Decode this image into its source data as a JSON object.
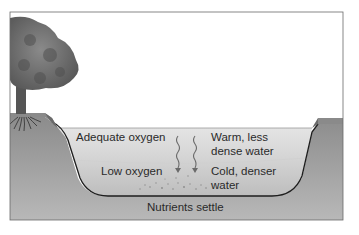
{
  "diagram": {
    "type": "lake-stratification-cross-section",
    "colors": {
      "background": "#ffffff",
      "frame": "#6a6a6a",
      "sky": "#ffffff",
      "soil": "#9c9c9c",
      "soil_dark": "#7d7d7d",
      "water_upper": "#dcdcdc",
      "water_lower": "#c2c2c2",
      "lake_bed_line": "#1e1e1e",
      "tree_canopy": "#6e6e6e",
      "tree_trunk": "#555555",
      "grass_bank": "#8a8a8a",
      "text": "#2a2a2a"
    },
    "labels": {
      "upper_left": "Adequate oxygen",
      "upper_right_line1": "Warm, less",
      "upper_right_line2": "dense water",
      "lower_left": "Low oxygen",
      "lower_right_line1": "Cold, denser",
      "lower_right_line2": "water",
      "bottom": "Nutrients settle"
    },
    "elements": [
      {
        "name": "tree",
        "position": "left bank"
      },
      {
        "name": "tree-roots",
        "position": "left bank below surface"
      },
      {
        "name": "left-bank",
        "position": "left"
      },
      {
        "name": "right-bank",
        "position": "right"
      },
      {
        "name": "upper-water-layer",
        "label_ref": "upper"
      },
      {
        "name": "lower-water-layer",
        "label_ref": "lower"
      },
      {
        "name": "downward-arrows",
        "count": 2,
        "style": "wavy"
      },
      {
        "name": "sediment-particles",
        "position": "lake bottom"
      }
    ]
  }
}
